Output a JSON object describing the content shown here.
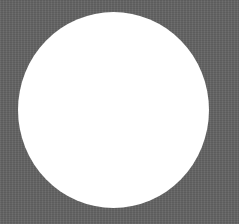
{
  "scene": {
    "description": "White circle on a textured gray background",
    "background_color": "#636363",
    "shape": {
      "type": "circle",
      "fill_color": "#ffffff",
      "left": 18,
      "top": 12,
      "width": 191,
      "height": 196
    }
  }
}
